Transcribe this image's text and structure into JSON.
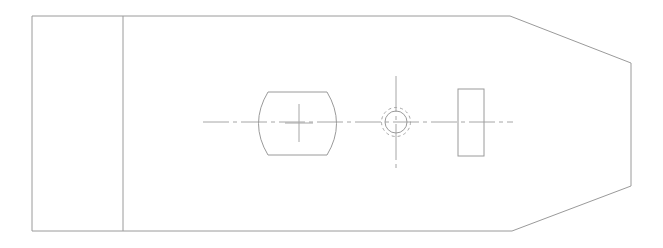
{
  "document": {
    "title": "Mechanical Part Plan View",
    "kind": "engineering-line-drawing",
    "background_color": "#ffffff",
    "canvas": {
      "width": 663,
      "height": 248
    }
  },
  "styles": {
    "outline_color": "#9a9a9a",
    "outline_width": 1,
    "feature_color": "#9a9a9a",
    "feature_width": 1,
    "centerline_color": "#a6a6a6",
    "centerline_width": 1,
    "hidden_color": "#a6a6a6",
    "hidden_width": 1,
    "centerline_dash": "18 4 3 4",
    "hidden_dash": "3 3"
  },
  "geometry": {
    "body_outline": {
      "name": "part-outline",
      "description": "Plate outline with chamfered right end",
      "points": "32,16 510,16 631,63 631,186 512,231 32,231"
    },
    "flange_divider": {
      "name": "flange-divider-line",
      "description": "Vertical line separating left mounting flange from body",
      "x": 123,
      "y1": 16,
      "y2": 231
    },
    "barrel": {
      "name": "barrel-boss",
      "description": "Barrel shaped boss with convex left and right ends",
      "left": 258,
      "right": 337,
      "top": 92,
      "bottom": 155,
      "bulge": 9,
      "path": "M 268,92 L 327,92 Q 346,123.5 327,155 L 268,155 Q 249,123.5 268,92 Z"
    },
    "barrel_center_cross": {
      "name": "barrel-center-cross",
      "cx": 299,
      "cy": 123,
      "arm_h": 14,
      "arm_v": 19
    },
    "hole": {
      "name": "through-hole",
      "cx": 396,
      "cy": 122,
      "solid_radius": 11,
      "hidden_radius": 14.5
    },
    "hole_vertical_centerline": {
      "name": "hole-vertical-centerline",
      "x": 396,
      "y1": 76,
      "y2": 170
    },
    "right_rib": {
      "name": "right-rib-rectangle",
      "x": 458,
      "y": 89,
      "width": 26,
      "height": 67
    },
    "main_centerline": {
      "name": "main-horizontal-centerline",
      "y": 122,
      "x1": 203,
      "x2": 513
    }
  },
  "labels": {
    "none_visible": ""
  }
}
